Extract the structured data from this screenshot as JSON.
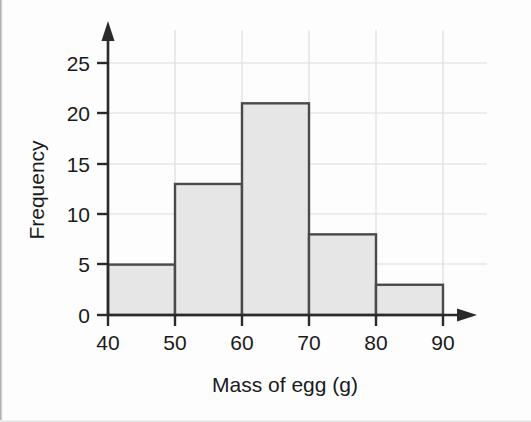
{
  "chart_data": {
    "type": "bar",
    "title": "",
    "subtitle": "",
    "xlabel": "Mass of egg (g)",
    "ylabel": "Frequency",
    "categories": [
      "40-50",
      "50-60",
      "60-70",
      "70-80",
      "80-90"
    ],
    "bin_edges": [
      40,
      50,
      60,
      70,
      80,
      90
    ],
    "values": [
      5,
      13,
      21,
      8,
      3
    ],
    "x": [
      40,
      50,
      60,
      70,
      80,
      90
    ],
    "xlim": [
      40,
      90
    ],
    "ylim": [
      0,
      27
    ],
    "xticks": [
      "40",
      "50",
      "60",
      "70",
      "80",
      "90"
    ],
    "yticks": [
      "0",
      "5",
      "10",
      "15",
      "20",
      "25"
    ],
    "ytick_values": [
      0,
      5,
      10,
      15,
      20,
      25
    ],
    "grid": true,
    "grid_axis": "both",
    "legend": false,
    "legend_position": "none",
    "bar_fill_color": "#e6e6e6",
    "bar_edge_color": "#4a4a4a",
    "gridline_color": "#dedede",
    "axis_color": "#2a2a2a",
    "background_color": "#fdfdfd",
    "axis_arrows": true,
    "annotations": []
  }
}
